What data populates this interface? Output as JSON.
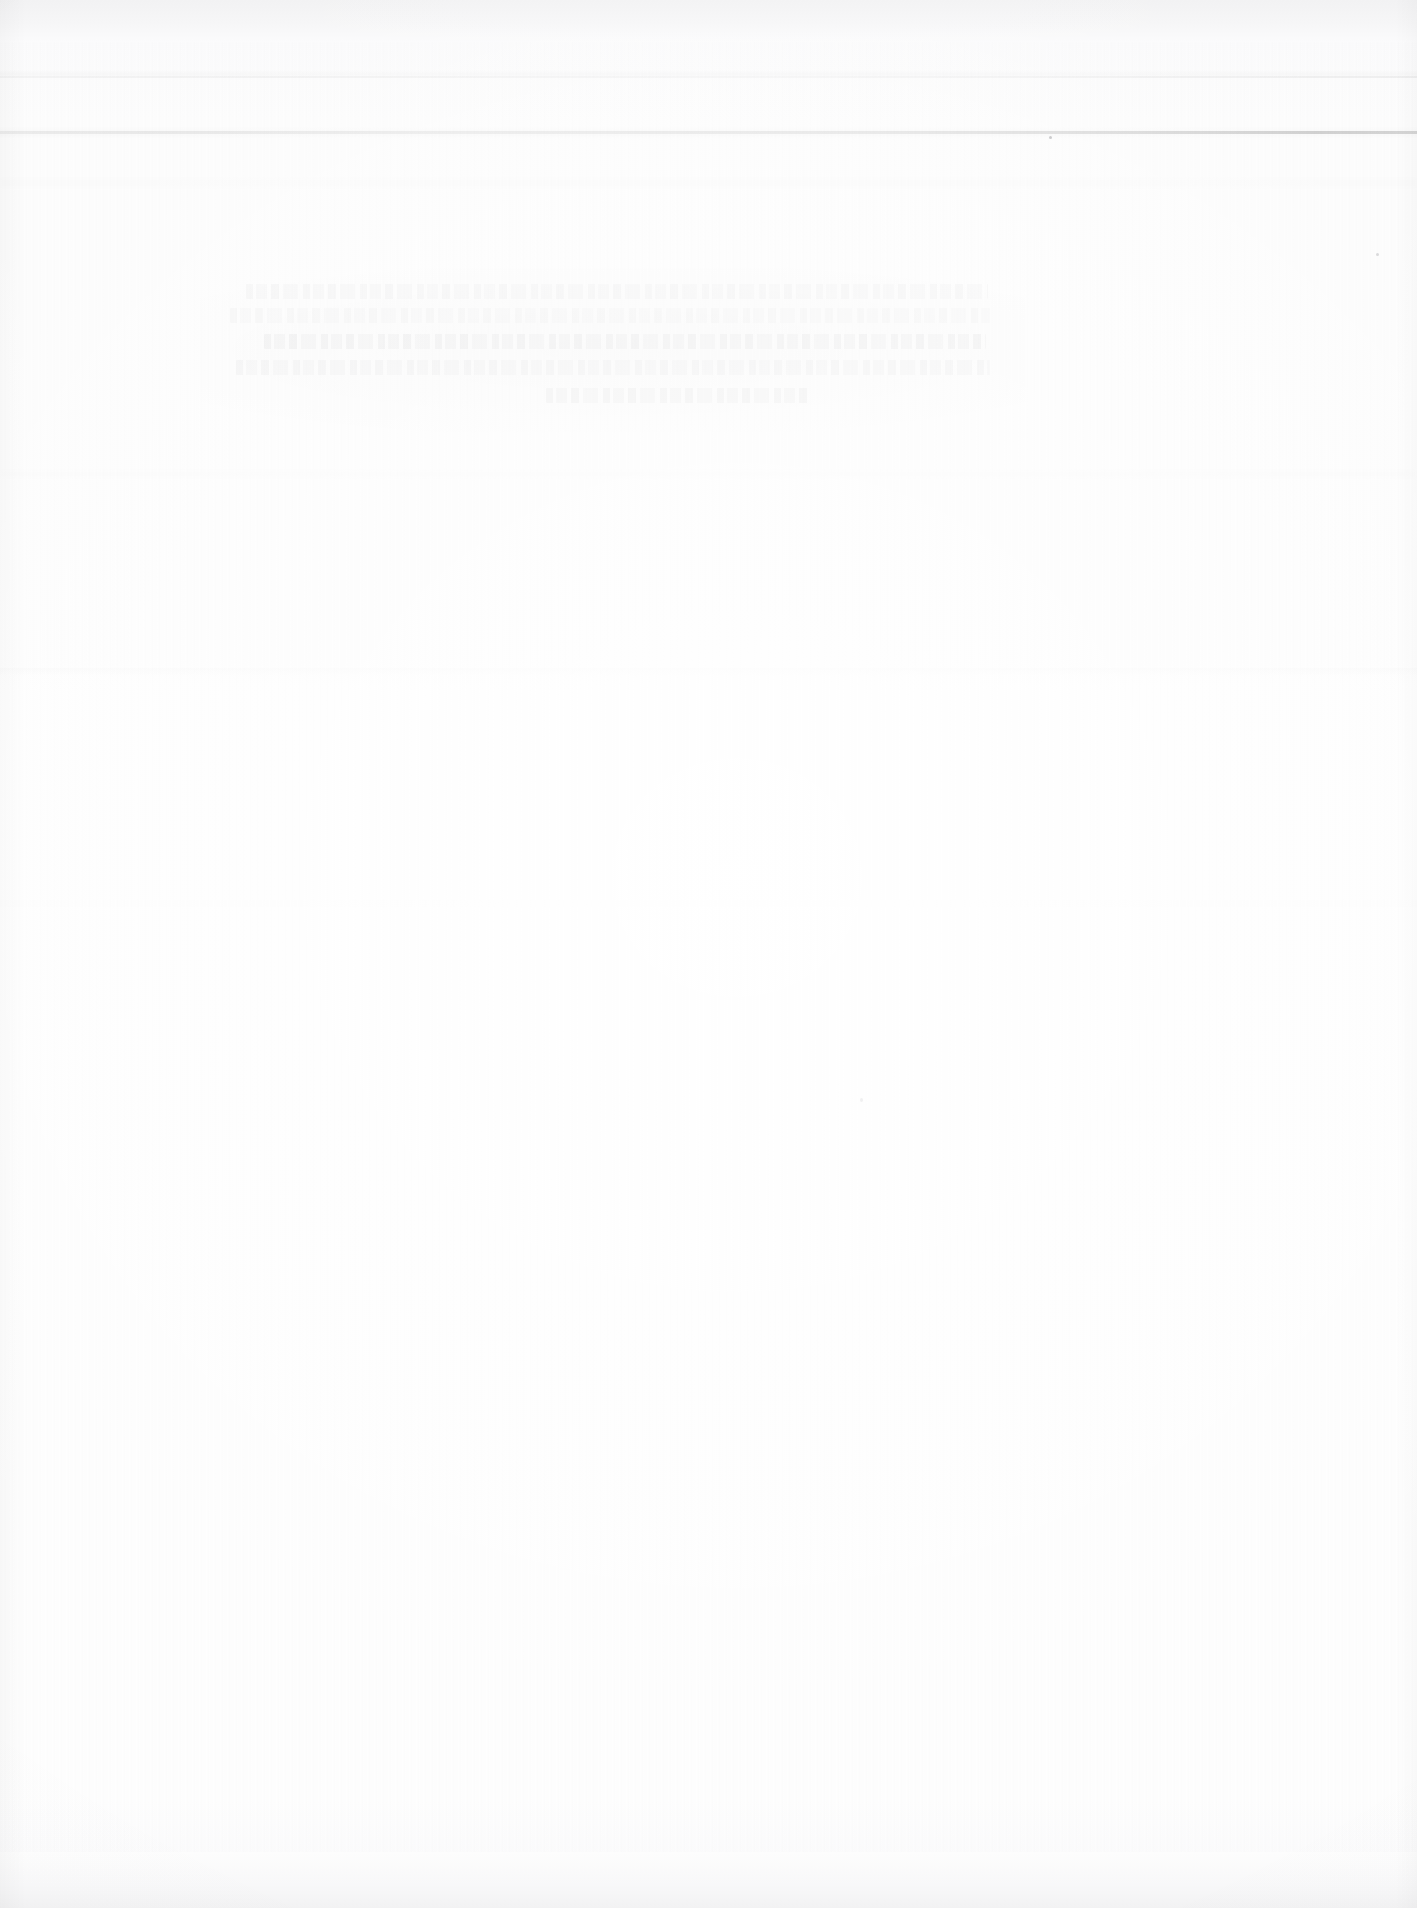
{
  "document": {
    "page_kind": "blank-scanned-page",
    "legibility": "illegible",
    "paper_color": "#fdfdfd",
    "ink_color": "#2a2a30",
    "visible_text": "",
    "notes_label": ""
  },
  "scan": {
    "top_band_color": "#f2f2f3",
    "bottom_band_color": "#f2f2f3",
    "edge_shadow_color": "#e9e9ea"
  },
  "rules": {
    "upper": {
      "label": "",
      "y": 76,
      "color": "#d9d9dc"
    },
    "main": {
      "label": "",
      "y": 131,
      "color": "#b8b8bd"
    }
  },
  "ghost_text": {
    "description_label": "",
    "lines": [
      {
        "text": "",
        "indent": 18,
        "width": 742
      },
      {
        "text": "",
        "indent": 2,
        "width": 760
      },
      {
        "text": "",
        "indent": 36,
        "width": 722
      },
      {
        "text": "",
        "indent": 8,
        "width": 754
      },
      {
        "text": "",
        "indent": 318,
        "width": 262
      }
    ]
  },
  "marks": {
    "speck_a_label": "",
    "speck_b_label": "",
    "speck_c_label": ""
  }
}
